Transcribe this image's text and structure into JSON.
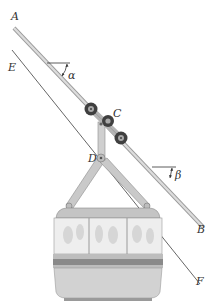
{
  "figure": {
    "type": "engineering-diagram",
    "labels": {
      "A": "A",
      "B": "B",
      "C": "C",
      "D": "D",
      "E": "E",
      "F": "F",
      "alpha": "α",
      "beta": "β"
    },
    "colors": {
      "cable": "#cfcfcf",
      "cable_edge": "#9a9a9a",
      "line_EF": "#555555",
      "cabin_body": "#d4d4d4",
      "cabin_stripe_dark": "#8a8a8a",
      "cabin_stripe_light": "#bdbdbd",
      "window": "#eeeeee",
      "wheel": "#4a4a4a",
      "label": "#333333"
    }
  }
}
